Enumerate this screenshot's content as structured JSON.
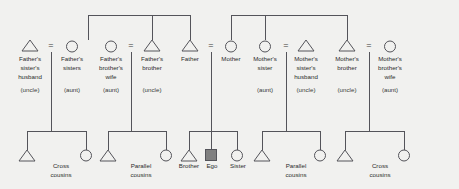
{
  "diagram": {
    "type": "kinship-genealogy",
    "colors": {
      "background": "#f1f1ef",
      "line": "#54545a",
      "text": "#2b2b2b",
      "ego_fill": "#808080"
    },
    "symbols": {
      "male": "triangle",
      "female": "circle",
      "ego": "filled-square",
      "marriage": "="
    },
    "legend": {
      "equals": "=",
      "equals_meaning": "marriage"
    }
  },
  "generation_parents": [
    {
      "id": "p1",
      "symbol": "triangle",
      "x": 30,
      "name": "Father's\nsister's\nhusband",
      "lines": [
        "Father's",
        "sister's",
        "husband"
      ],
      "relation": "(uncle)"
    },
    {
      "id": "p2",
      "symbol": "circle",
      "x": 72,
      "name": "Father's\nsisters",
      "lines": [
        "Father's",
        "sisters"
      ],
      "relation": "(aunt)"
    },
    {
      "id": "p3",
      "symbol": "circle",
      "x": 111,
      "name": "Father's\nbrother's\nwife",
      "lines": [
        "Father's",
        "brother's",
        "wife"
      ],
      "relation": "(aunt)"
    },
    {
      "id": "p4",
      "symbol": "triangle",
      "x": 152,
      "name": "Father's\nbrother",
      "lines": [
        "Father's",
        "brother"
      ],
      "relation": "(uncle)"
    },
    {
      "id": "p5",
      "symbol": "triangle",
      "x": 190,
      "name": "Father",
      "lines": [
        "Father"
      ],
      "relation": ""
    },
    {
      "id": "p6",
      "symbol": "circle",
      "x": 231,
      "name": "Mother",
      "lines": [
        "Mother"
      ],
      "relation": ""
    },
    {
      "id": "p7",
      "symbol": "circle",
      "x": 265,
      "name": "Mother's\nsister",
      "lines": [
        "Mother's",
        "sister"
      ],
      "relation": "(aunt)"
    },
    {
      "id": "p8",
      "symbol": "triangle",
      "x": 306,
      "name": "Mother's\nsister's\nhusband",
      "lines": [
        "Mother's",
        "sister's",
        "husband"
      ],
      "relation": "(uncle)"
    },
    {
      "id": "p9",
      "symbol": "triangle",
      "x": 347,
      "name": "Mother's\nbrother",
      "lines": [
        "Mother's",
        "brother"
      ],
      "relation": "(uncle)"
    },
    {
      "id": "p10",
      "symbol": "circle",
      "x": 390,
      "name": "Mother's\nbrother's\nwife",
      "lines": [
        "Mother's",
        "brother's",
        "wife"
      ],
      "relation": "(aunt)"
    }
  ],
  "marriages": [
    {
      "id": "m1",
      "equals_x": 51,
      "left": "p1",
      "right": "p2",
      "descent_x": 51
    },
    {
      "id": "m2",
      "equals_x": 131,
      "left": "p3",
      "right": "p4",
      "descent_x": 131
    },
    {
      "id": "m3",
      "equals_x": 211,
      "left": "p5",
      "right": "p6",
      "descent_x": 211
    },
    {
      "id": "m4",
      "equals_x": 286,
      "left": "p7",
      "right": "p8",
      "descent_x": 286
    },
    {
      "id": "m5",
      "equals_x": 369,
      "left": "p9",
      "right": "p10",
      "descent_x": 369
    }
  ],
  "sibling_bars": [
    {
      "id": "sb-paternal",
      "label": "paternal siblings",
      "x1": 88,
      "x2": 190,
      "y": 15,
      "stems": [
        88,
        152,
        190
      ]
    },
    {
      "id": "sb-maternal",
      "label": "maternal siblings",
      "x1": 231,
      "x2": 347,
      "y": 15,
      "stems": [
        231,
        265,
        347
      ]
    }
  ],
  "generation_children": [
    {
      "id": "fam-left",
      "group_label": "Cross\ncousins",
      "label_lines": [
        "Cross",
        "cousins"
      ],
      "label_x": 61,
      "bar_y": 131,
      "parent_x": 51,
      "children": [
        {
          "symbol": "triangle",
          "x": 27,
          "label": ""
        },
        {
          "symbol": "circle",
          "x": 86,
          "label": ""
        }
      ]
    },
    {
      "id": "fam-midleft",
      "group_label": "Parallel\ncousins",
      "label_lines": [
        "Parallel",
        "cousins"
      ],
      "label_x": 141,
      "bar_y": 131,
      "parent_x": 131,
      "children": [
        {
          "symbol": "triangle",
          "x": 108,
          "label": ""
        },
        {
          "symbol": "circle",
          "x": 166,
          "label": ""
        }
      ]
    },
    {
      "id": "fam-ego",
      "group_label": "",
      "label_lines": [],
      "label_x": 211,
      "bar_y": 131,
      "parent_x": 211,
      "children": [
        {
          "symbol": "triangle",
          "x": 189,
          "label": "Brother"
        },
        {
          "symbol": "filled-square",
          "x": 211,
          "label": "Ego"
        },
        {
          "symbol": "circle",
          "x": 237,
          "label": "Sister"
        }
      ]
    },
    {
      "id": "fam-midright",
      "group_label": "Parallel\ncousins",
      "label_lines": [
        "Parallel",
        "cousins"
      ],
      "label_x": 296,
      "bar_y": 131,
      "parent_x": 286,
      "children": [
        {
          "symbol": "triangle",
          "x": 262,
          "label": ""
        },
        {
          "symbol": "circle",
          "x": 320,
          "label": ""
        }
      ]
    },
    {
      "id": "fam-right",
      "group_label": "Cross\ncousins",
      "label_lines": [
        "Cross",
        "cousins"
      ],
      "label_x": 380,
      "bar_y": 131,
      "parent_x": 369,
      "children": [
        {
          "symbol": "triangle",
          "x": 345,
          "label": ""
        },
        {
          "symbol": "circle",
          "x": 404,
          "label": ""
        }
      ]
    }
  ],
  "child_labels": [
    {
      "text": "Cross",
      "x": 61,
      "y": 166
    },
    {
      "text": "cousins",
      "x": 61,
      "y": 175
    },
    {
      "text": "Parallel",
      "x": 141,
      "y": 166
    },
    {
      "text": "cousins",
      "x": 141,
      "y": 175
    },
    {
      "text": "Brother",
      "x": 189,
      "y": 166
    },
    {
      "text": "Ego",
      "x": 212,
      "y": 166
    },
    {
      "text": "Sister",
      "x": 238,
      "y": 166
    },
    {
      "text": "Parallel",
      "x": 296,
      "y": 166
    },
    {
      "text": "cousins",
      "x": 296,
      "y": 175
    },
    {
      "text": "Cross",
      "x": 380,
      "y": 166
    },
    {
      "text": "cousins",
      "x": 380,
      "y": 175
    }
  ]
}
